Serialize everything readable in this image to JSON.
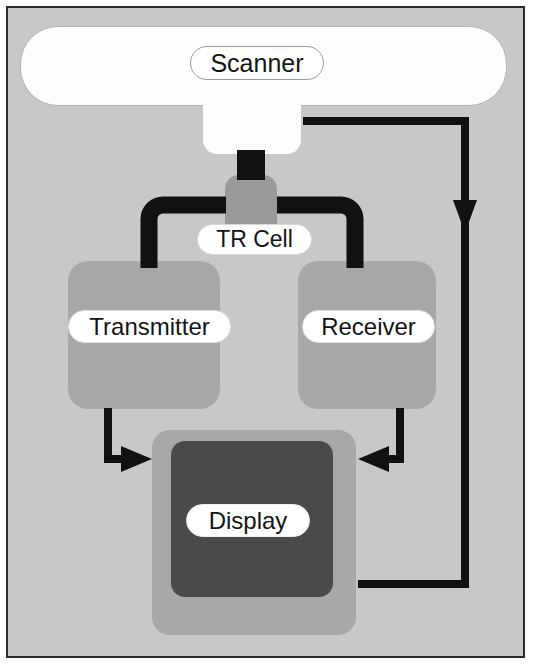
{
  "diagram": {
    "background_color": "#c8c8c8",
    "frame_border_color": "#2b2b2b",
    "wire_color": "#111111",
    "nodes": [
      {
        "id": "scanner",
        "label": "Scanner",
        "shape": "rounded-bar",
        "fill": "#fdfdfd"
      },
      {
        "id": "scanner_neck",
        "label": "",
        "shape": "neck",
        "fill": "#fdfdfd"
      },
      {
        "id": "tr_cell",
        "label": "TR Cell",
        "shape": "rounded-small",
        "fill": "#9a9a9a"
      },
      {
        "id": "transmitter",
        "label": "Transmitter",
        "shape": "rounded-box",
        "fill": "#a8a8a8"
      },
      {
        "id": "receiver",
        "label": "Receiver",
        "shape": "rounded-box",
        "fill": "#a8a8a8"
      },
      {
        "id": "display",
        "label": "Display",
        "shape": "rounded-box",
        "fill": "#a8a8a8",
        "screen_fill": "#4a4a4a"
      }
    ],
    "connections": [
      {
        "from": "scanner_neck",
        "to": "tr_cell",
        "style": "thick-bar",
        "arrow": false
      },
      {
        "from": "tr_cell",
        "to": "transmitter",
        "style": "thick-elbow",
        "arrow": false
      },
      {
        "from": "tr_cell",
        "to": "receiver",
        "style": "thick-elbow",
        "arrow": false
      },
      {
        "from": "transmitter",
        "to": "display",
        "style": "thin-elbow",
        "arrow": true
      },
      {
        "from": "receiver",
        "to": "display",
        "style": "thin-elbow",
        "arrow": true
      },
      {
        "from": "scanner_neck",
        "to": "display",
        "style": "thin-loop",
        "arrow": true
      }
    ]
  },
  "labels": {
    "scanner": "Scanner",
    "tr_cell": "TR Cell",
    "transmitter": "Transmitter",
    "receiver": "Receiver",
    "display": "Display"
  }
}
